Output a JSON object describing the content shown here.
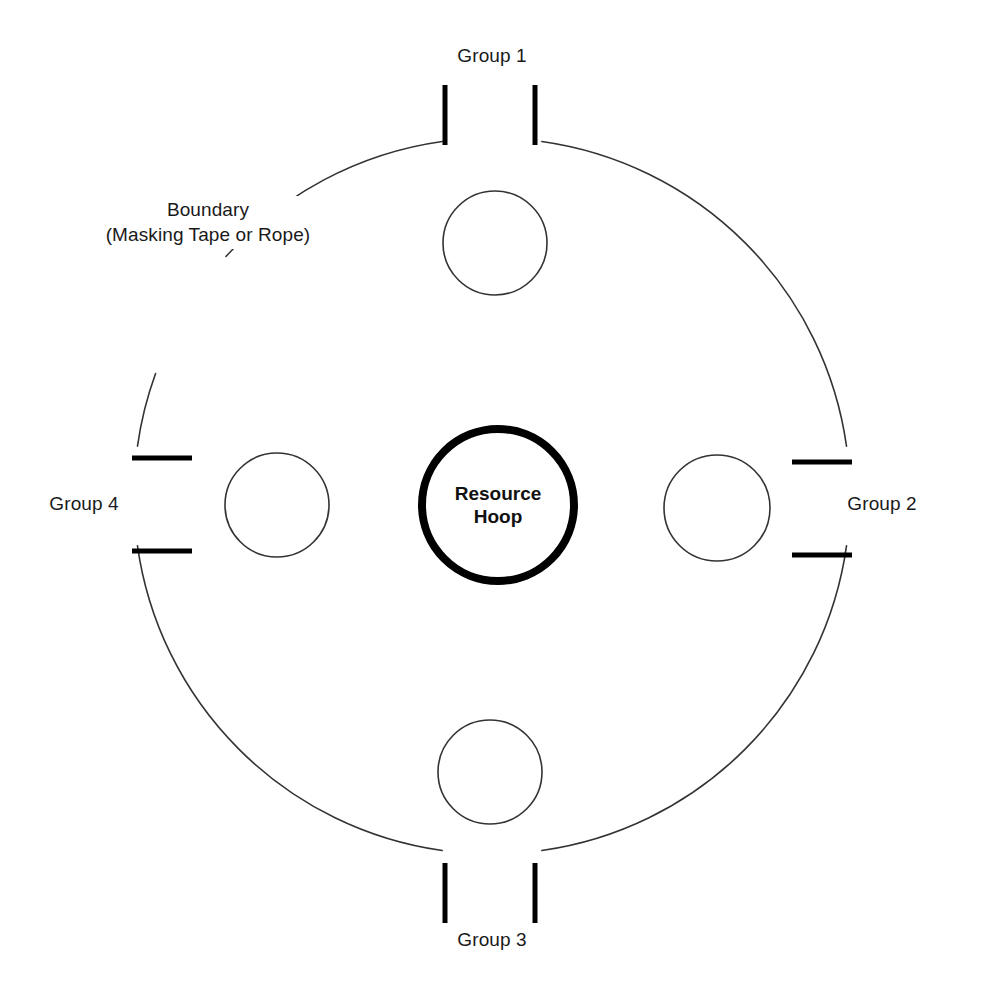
{
  "diagram": {
    "type": "activity-setup-diagram",
    "canvas": {
      "width": 986,
      "height": 1002,
      "background": "#ffffff"
    },
    "colors": {
      "line": "#333333",
      "gate_mark": "#000000",
      "hoop_stroke": "#000000",
      "text": "#1a1a1a",
      "background": "#ffffff"
    },
    "boundary": {
      "label_line_1": "Boundary",
      "label_line_2": "(Masking Tape or Rope)",
      "label_x": 208,
      "label_y": 196,
      "center_x": 492,
      "center_y": 496,
      "radius": 358,
      "stroke_width": 1.6,
      "gap_degrees": 8,
      "label_gap": {
        "start_deg": 200,
        "end_deg": 222
      }
    },
    "center_hoop": {
      "label_line_1": "Resource",
      "label_line_2": "Hoop",
      "center_x": 498,
      "center_y": 505,
      "radius": 76,
      "stroke_width": 8
    },
    "groups": [
      {
        "id": "group-1",
        "label": "Group 1",
        "position": "top",
        "label_x": 492,
        "label_y": 44,
        "circle": {
          "cx": 495,
          "cy": 243,
          "r": 52
        },
        "gate": {
          "orientation": "vertical",
          "left_x": 445,
          "right_x": 535,
          "y_start": 85,
          "y_end": 145,
          "thickness": 5
        }
      },
      {
        "id": "group-2",
        "label": "Group 2",
        "position": "right",
        "label_x": 882,
        "label_y": 492,
        "circle": {
          "cx": 717,
          "cy": 508,
          "r": 53
        },
        "gate": {
          "orientation": "horizontal",
          "top_y": 462,
          "bottom_y": 555,
          "x_start": 792,
          "x_end": 852,
          "thickness": 5
        }
      },
      {
        "id": "group-3",
        "label": "Group 3",
        "position": "bottom",
        "label_x": 492,
        "label_y": 928,
        "circle": {
          "cx": 490,
          "cy": 772,
          "r": 52
        },
        "gate": {
          "orientation": "vertical",
          "left_x": 445,
          "right_x": 535,
          "y_start": 863,
          "y_end": 923,
          "thickness": 5
        }
      },
      {
        "id": "group-4",
        "label": "Group 4",
        "position": "left",
        "label_x": 84,
        "label_y": 492,
        "circle": {
          "cx": 277,
          "cy": 505,
          "r": 52
        },
        "gate": {
          "orientation": "horizontal",
          "top_y": 458,
          "bottom_y": 551,
          "x_start": 132,
          "x_end": 192,
          "thickness": 5
        }
      }
    ]
  }
}
